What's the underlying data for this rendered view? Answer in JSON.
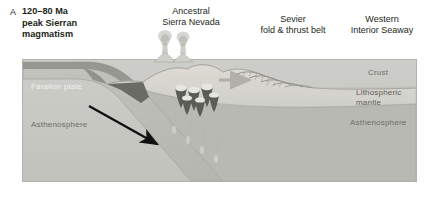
{
  "figure": {
    "panel_letter": "A",
    "type": "geologic-cross-section"
  },
  "labels": {
    "arc": "Ancestral\nSierra Nevada",
    "sevier": "Sevier\nfold & thrust belt",
    "seaway": "Western\nInterior Seaway",
    "farallon_plate": "Farallon plate",
    "asthenosphere_left": "Asthenosphere",
    "crust": "Crust",
    "lithospheric_mantle": "Lithospheric\nmantle",
    "asthenosphere_right": "Asthenosphere"
  },
  "colors": {
    "background": "#ffffff",
    "asthenosphere": "#c9c9c5",
    "crust": "#d7d7d2",
    "lithospheric_mantle": "#b4b4ae",
    "oceanic_crust": "#8f8f89",
    "slab": "#bcbcb6",
    "accretionary_wedge": "#6b6b66",
    "pluton": "#5c5c57",
    "plume": "#a8a8a2",
    "arrow_subduction": "#111111",
    "arrow_compression": "#a0a09a",
    "frame_border": "#b2b2ad",
    "text": "#231f20",
    "text_on_slab": "#f2f2ee",
    "text_inner": "#6e6e69"
  },
  "features": {
    "subduction_arrow": "down-dip motion of Farallon plate",
    "compression_arrow": "eastward crustal shortening",
    "volcano_count": 2,
    "pluton_count": 6,
    "thrust_fault_count": 5,
    "melt_conduit_count": 4
  }
}
